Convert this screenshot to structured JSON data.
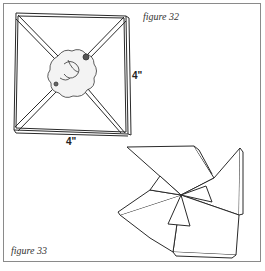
{
  "figures": [
    {
      "id": "figure-32",
      "caption": "figure 32",
      "description": "Flat square with diagonal folds and a fluffy center puff",
      "dimensions": {
        "height_label": "4\"",
        "width_label": "4\""
      }
    },
    {
      "id": "figure-33",
      "caption": "figure 33",
      "description": "Square folded into a pinwheel shape with puff at center"
    }
  ],
  "colors": {
    "line": "#2a2a2a",
    "frame": "#8a8a8a",
    "background": "#ffffff"
  }
}
